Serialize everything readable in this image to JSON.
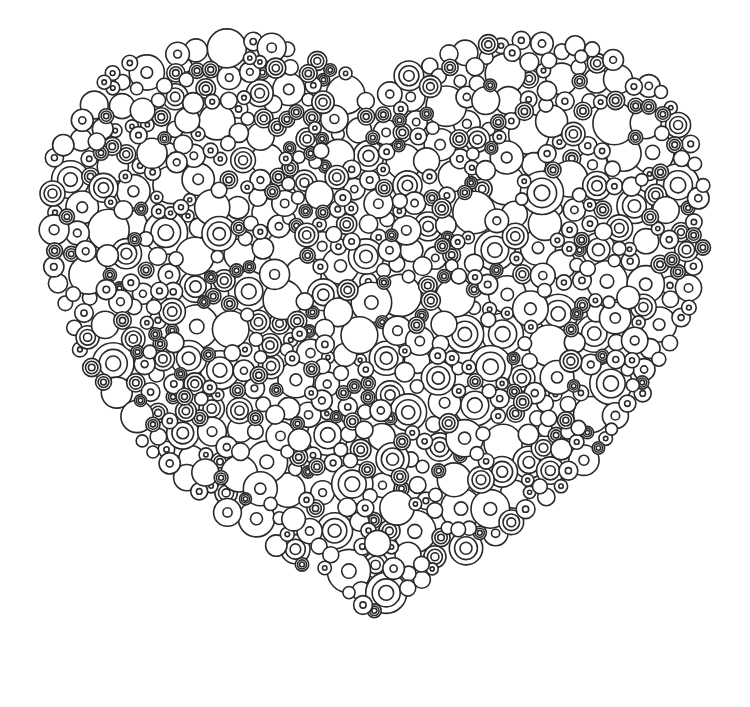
{
  "page": {
    "background": "#ffffff",
    "stroke_color": "#2a2a2a"
  },
  "illustration": {
    "shape": "heart",
    "element": "circles",
    "styles": [
      "plain-circle",
      "circle-with-dot",
      "concentric-rings"
    ],
    "bounds": {
      "left": 28,
      "top": 30,
      "right": 722,
      "bottom": 680
    },
    "min_radius": 6,
    "max_radius": 22,
    "count": 900,
    "seed": 7
  }
}
